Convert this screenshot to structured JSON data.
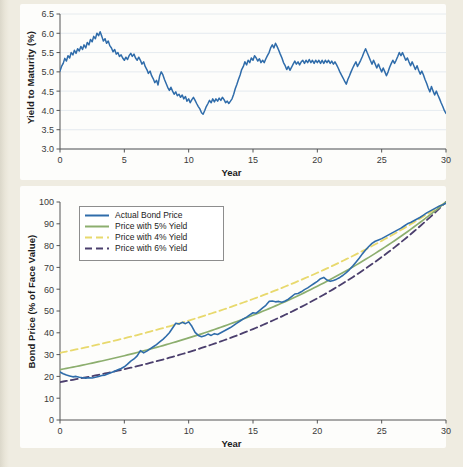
{
  "page": {
    "background_color": "#efece1",
    "panel_color": "#fdfdfb"
  },
  "palette": {
    "actual": "#2f6caa",
    "yield5": "#8cae6e",
    "yield4": "#e8d96d",
    "yield6": "#4b3f6d",
    "axis": "#555555",
    "grid": "#dfe6ec",
    "text": "#1b1b1b"
  },
  "chart_data": [
    {
      "type": "line",
      "id": "yield-to-maturity",
      "title": "",
      "xlabel": "Year",
      "ylabel": "Yield to Maturity (%)",
      "xlim": [
        0,
        30
      ],
      "ylim": [
        3.0,
        6.5
      ],
      "xticks": [
        0,
        5,
        10,
        15,
        20,
        25,
        30
      ],
      "yticks": [
        3.0,
        3.5,
        4.0,
        4.5,
        5.0,
        5.5,
        6.0,
        6.5
      ],
      "xtick_labels": [
        "0",
        "5",
        "10",
        "15",
        "20",
        "25",
        "30"
      ],
      "ytick_labels": [
        "3.0",
        "3.5",
        "4.0",
        "4.5",
        "5.0",
        "5.5",
        "6.0",
        "6.5"
      ],
      "grid": "horizontal",
      "legend": "none",
      "series": [
        {
          "name": "Yield to Maturity",
          "color": "#2f6caa",
          "style": "solid",
          "x": [
            0,
            0.12,
            0.25,
            0.37,
            0.5,
            0.62,
            0.75,
            0.87,
            1,
            1.12,
            1.25,
            1.37,
            1.5,
            1.62,
            1.75,
            1.87,
            2,
            2.12,
            2.25,
            2.37,
            2.5,
            2.62,
            2.75,
            2.87,
            3,
            3.12,
            3.25,
            3.37,
            3.5,
            3.62,
            3.75,
            3.87,
            4,
            4.12,
            4.25,
            4.37,
            4.5,
            4.62,
            4.75,
            4.87,
            5,
            5.12,
            5.25,
            5.37,
            5.5,
            5.62,
            5.75,
            5.87,
            6,
            6.12,
            6.25,
            6.37,
            6.5,
            6.62,
            6.75,
            6.87,
            7,
            7.12,
            7.25,
            7.37,
            7.5,
            7.62,
            7.75,
            7.87,
            8,
            8.12,
            8.25,
            8.37,
            8.5,
            8.62,
            8.75,
            8.87,
            9,
            9.12,
            9.25,
            9.37,
            9.5,
            9.62,
            9.75,
            9.87,
            10,
            10.12,
            10.25,
            10.37,
            10.5,
            10.62,
            10.75,
            10.87,
            11,
            11.12,
            11.25,
            11.37,
            11.5,
            11.62,
            11.75,
            11.87,
            12,
            12.12,
            12.25,
            12.37,
            12.5,
            12.62,
            12.75,
            12.87,
            13,
            13.12,
            13.25,
            13.37,
            13.5,
            13.62,
            13.75,
            13.87,
            14,
            14.12,
            14.25,
            14.37,
            14.5,
            14.62,
            14.75,
            14.87,
            15,
            15.12,
            15.25,
            15.37,
            15.5,
            15.62,
            15.75,
            15.87,
            16,
            16.12,
            16.25,
            16.37,
            16.5,
            16.62,
            16.75,
            16.87,
            17,
            17.12,
            17.25,
            17.37,
            17.5,
            17.62,
            17.75,
            17.87,
            18,
            18.12,
            18.25,
            18.37,
            18.5,
            18.62,
            18.75,
            18.87,
            19,
            19.12,
            19.25,
            19.37,
            19.5,
            19.62,
            19.75,
            19.87,
            20,
            20.12,
            20.25,
            20.37,
            20.5,
            20.62,
            20.75,
            20.87,
            21,
            21.12,
            21.25,
            21.37,
            21.5,
            21.62,
            21.75,
            21.87,
            22,
            22.12,
            22.25,
            22.37,
            22.5,
            22.62,
            22.75,
            22.87,
            23,
            23.12,
            23.25,
            23.37,
            23.5,
            23.62,
            23.75,
            23.87,
            24,
            24.12,
            24.25,
            24.37,
            24.5,
            24.62,
            24.75,
            24.87,
            25,
            25.12,
            25.25,
            25.37,
            25.5,
            25.62,
            25.75,
            25.87,
            26,
            26.12,
            26.25,
            26.37,
            26.5,
            26.62,
            26.75,
            26.87,
            27,
            27.12,
            27.25,
            27.37,
            27.5,
            27.62,
            27.75,
            27.87,
            28,
            28.12,
            28.25,
            28.37,
            28.5,
            28.62,
            28.75,
            28.87,
            29,
            29.12,
            29.25,
            29.37,
            29.5,
            29.62,
            29.75,
            29.87,
            30
          ],
          "y": [
            5.02,
            5.14,
            5.22,
            5.35,
            5.28,
            5.42,
            5.36,
            5.5,
            5.44,
            5.56,
            5.48,
            5.6,
            5.54,
            5.66,
            5.58,
            5.7,
            5.62,
            5.76,
            5.7,
            5.84,
            5.78,
            5.92,
            5.86,
            6.0,
            5.94,
            6.04,
            5.92,
            5.8,
            5.86,
            5.74,
            5.8,
            5.68,
            5.62,
            5.52,
            5.58,
            5.46,
            5.5,
            5.4,
            5.44,
            5.36,
            5.3,
            5.38,
            5.32,
            5.42,
            5.48,
            5.4,
            5.46,
            5.36,
            5.3,
            5.38,
            5.3,
            5.2,
            5.26,
            5.14,
            5.06,
            4.96,
            5.02,
            4.9,
            4.82,
            4.72,
            4.78,
            4.66,
            4.9,
            5.0,
            4.92,
            4.8,
            4.7,
            4.6,
            4.52,
            4.6,
            4.5,
            4.42,
            4.48,
            4.38,
            4.42,
            4.34,
            4.4,
            4.3,
            4.36,
            4.24,
            4.3,
            4.2,
            4.28,
            4.34,
            4.26,
            4.18,
            4.1,
            4.04,
            3.94,
            3.9,
            4.0,
            4.1,
            4.18,
            4.26,
            4.2,
            4.3,
            4.22,
            4.3,
            4.24,
            4.32,
            4.26,
            4.34,
            4.28,
            4.2,
            4.24,
            4.18,
            4.24,
            4.3,
            4.42,
            4.56,
            4.68,
            4.8,
            4.92,
            5.06,
            5.14,
            5.26,
            5.18,
            5.3,
            5.24,
            5.36,
            5.3,
            5.42,
            5.36,
            5.28,
            5.34,
            5.24,
            5.3,
            5.24,
            5.34,
            5.42,
            5.5,
            5.62,
            5.7,
            5.62,
            5.74,
            5.66,
            5.56,
            5.46,
            5.36,
            5.24,
            5.16,
            5.06,
            5.14,
            5.04,
            5.12,
            5.2,
            5.28,
            5.2,
            5.26,
            5.18,
            5.26,
            5.3,
            5.22,
            5.3,
            5.24,
            5.32,
            5.24,
            5.3,
            5.22,
            5.3,
            5.24,
            5.3,
            5.22,
            5.3,
            5.22,
            5.3,
            5.24,
            5.3,
            5.22,
            5.28,
            5.2,
            5.26,
            5.18,
            5.1,
            5.0,
            4.92,
            4.84,
            4.76,
            4.68,
            4.8,
            4.9,
            5.0,
            5.1,
            5.18,
            5.26,
            5.14,
            5.22,
            5.3,
            5.4,
            5.5,
            5.6,
            5.5,
            5.4,
            5.3,
            5.2,
            5.3,
            5.2,
            5.1,
            5.2,
            5.1,
            5.0,
            5.1,
            5.0,
            4.9,
            5.0,
            5.12,
            5.22,
            5.3,
            5.22,
            5.3,
            5.4,
            5.5,
            5.42,
            5.5,
            5.4,
            5.3,
            5.36,
            5.26,
            5.16,
            5.26,
            5.16,
            5.06,
            5.16,
            5.04,
            4.94,
            5.02,
            4.92,
            4.8,
            4.7,
            4.58,
            4.48,
            4.62,
            4.5,
            4.4,
            4.5,
            4.4,
            4.3,
            4.2,
            4.1,
            4.0,
            3.92,
            3.9,
            4.0,
            3.96,
            4.06,
            4.0,
            4.1,
            4.2,
            4.3,
            4.24,
            4.32,
            4.26,
            4.34,
            4.28,
            4.2,
            4.26,
            4.16,
            4.22,
            4.12,
            4.06,
            4.14,
            4.08,
            4.16,
            4.3,
            4.46,
            4.6,
            4.7,
            4.78,
            4.74,
            4.82,
            4.76,
            4.86,
            4.96,
            5.06,
            5.16,
            5.26,
            5.2,
            5.28,
            5.4,
            5.5,
            5.6,
            5.52,
            5.64,
            5.74,
            5.66,
            5.56,
            5.46,
            5.38,
            5.3,
            5.2,
            5.28,
            5.38,
            5.3,
            5.4,
            5.32,
            5.24,
            5.3,
            5.2,
            5.3,
            5.22,
            5.3,
            5.22,
            5.14,
            5.2,
            5.3,
            5.42,
            5.54,
            5.62
          ]
        }
      ]
    },
    {
      "type": "line",
      "id": "bond-price",
      "title": "",
      "xlabel": "Year",
      "ylabel": "Bond Price (% of Face Value)",
      "xlim": [
        0,
        30
      ],
      "ylim": [
        0,
        100
      ],
      "xticks": [
        0,
        5,
        10,
        15,
        20,
        25,
        30
      ],
      "yticks": [
        0,
        10,
        20,
        30,
        40,
        50,
        60,
        70,
        80,
        90,
        100
      ],
      "xtick_labels": [
        "0",
        "5",
        "10",
        "15",
        "20",
        "25",
        "30"
      ],
      "ytick_labels": [
        "0",
        "10",
        "20",
        "30",
        "40",
        "50",
        "60",
        "70",
        "80",
        "90",
        "100"
      ],
      "grid": "none",
      "legend": "upper-left",
      "series": [
        {
          "name": "Actual Bond Price",
          "color": "#2f6caa",
          "style": "solid",
          "x": [
            0,
            0.25,
            0.5,
            0.75,
            1,
            1.25,
            1.5,
            1.75,
            2,
            2.25,
            2.5,
            2.75,
            3,
            3.25,
            3.5,
            3.75,
            4,
            4.25,
            4.5,
            4.75,
            5,
            5.25,
            5.5,
            5.75,
            6,
            6.25,
            6.5,
            6.75,
            7,
            7.25,
            7.5,
            7.75,
            8,
            8.25,
            8.5,
            8.75,
            9,
            9.25,
            9.5,
            9.75,
            10,
            10.25,
            10.5,
            10.75,
            11,
            11.25,
            11.5,
            11.75,
            12,
            12.25,
            12.5,
            12.75,
            13,
            13.25,
            13.5,
            13.75,
            14,
            14.25,
            14.5,
            14.75,
            15,
            15.25,
            15.5,
            15.75,
            16,
            16.25,
            16.5,
            16.75,
            17,
            17.25,
            17.5,
            17.75,
            18,
            18.25,
            18.5,
            18.75,
            19,
            19.25,
            19.5,
            19.75,
            20,
            20.25,
            20.5,
            20.75,
            21,
            21.25,
            21.5,
            21.75,
            22,
            22.25,
            22.5,
            22.75,
            23,
            23.25,
            23.5,
            23.75,
            24,
            24.25,
            24.5,
            24.75,
            25,
            25.25,
            25.5,
            25.75,
            26,
            26.25,
            26.5,
            26.75,
            27,
            27.25,
            27.5,
            27.75,
            28,
            28.25,
            28.5,
            28.75,
            29,
            29.25,
            29.5,
            29.75,
            30
          ],
          "y": [
            22.0,
            21.2,
            20.6,
            20.2,
            19.8,
            20.0,
            19.6,
            19.4,
            19.2,
            19.4,
            19.3,
            19.6,
            20.0,
            20.4,
            20.6,
            21.2,
            21.8,
            22.4,
            23.0,
            23.6,
            24.4,
            25.6,
            27.0,
            28.0,
            29.4,
            31.8,
            30.8,
            31.6,
            32.6,
            33.6,
            34.6,
            35.8,
            37.0,
            38.4,
            40.0,
            42.2,
            44.4,
            44.0,
            44.8,
            44.2,
            45.0,
            43.0,
            40.2,
            38.8,
            38.2,
            38.6,
            39.4,
            38.8,
            39.6,
            39.2,
            40.0,
            40.8,
            41.6,
            42.4,
            43.4,
            44.4,
            45.4,
            46.4,
            47.2,
            48.2,
            49.2,
            49.0,
            50.2,
            51.4,
            52.6,
            54.4,
            54.6,
            54.2,
            54.4,
            54.0,
            54.6,
            55.4,
            56.6,
            57.8,
            58.0,
            58.8,
            59.8,
            60.6,
            61.6,
            62.6,
            63.6,
            64.8,
            65.4,
            64.2,
            63.6,
            64.0,
            64.6,
            65.4,
            66.4,
            67.6,
            69.0,
            70.6,
            72.4,
            74.2,
            76.2,
            78.0,
            79.6,
            81.0,
            82.0,
            82.6,
            83.2,
            84.0,
            84.8,
            85.6,
            86.4,
            87.2,
            88.0,
            89.0,
            90.0,
            90.6,
            91.4,
            92.2,
            93.0,
            94.0,
            95.0,
            95.8,
            96.6,
            97.4,
            98.2,
            98.8,
            99.4,
            100.0
          ]
        },
        {
          "name": "Price with 5% Yield",
          "color": "#8cae6e",
          "style": "solid",
          "value_at_0": 23.1,
          "value_at_30": 100.0
        },
        {
          "name": "Price with 4% Yield",
          "color": "#e8d96d",
          "style": "dashed",
          "value_at_0": 30.8,
          "value_at_30": 100.0
        },
        {
          "name": "Price with 6% Yield",
          "color": "#4b3f6d",
          "style": "dashed",
          "value_at_0": 17.4,
          "value_at_30": 100.0
        }
      ],
      "legend_entries": [
        {
          "label": "Actual Bond Price",
          "color": "#2f6caa",
          "style": "solid"
        },
        {
          "label": "Price with 5% Yield",
          "color": "#8cae6e",
          "style": "solid"
        },
        {
          "label": "Price with 4% Yield",
          "color": "#e8d96d",
          "style": "dashed"
        },
        {
          "label": "Price with 6% Yield",
          "color": "#4b3f6d",
          "style": "dashed"
        }
      ]
    }
  ]
}
